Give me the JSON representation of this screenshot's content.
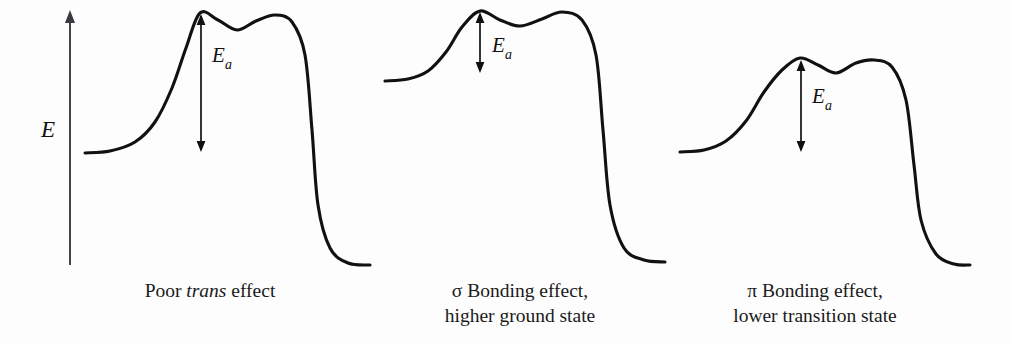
{
  "figure": {
    "type": "reaction-energy-profile-diagram",
    "background_color": "#fdfdfd",
    "curve_color": "#111111",
    "axis_color": "#3a3a40",
    "axis": {
      "label": "E",
      "meaning": "energy",
      "orientation": "vertical",
      "arrow_direction": "up",
      "x": 70,
      "y_top": 10,
      "y_bottom": 265,
      "label_x": 48,
      "label_y": 137
    }
  },
  "panels": [
    {
      "id": "panel-1",
      "caption_lines": [
        "Poor trans effect"
      ],
      "caption_parts": [
        {
          "text": "Poor ",
          "italic": false
        },
        {
          "text": "trans",
          "italic": true
        },
        {
          "text": " effect",
          "italic": false
        }
      ],
      "ea_label": "E",
      "ea_subscript": "a",
      "ea_arrow": {
        "x": 201,
        "y_top": 14,
        "y_bottom": 152
      },
      "ea_label_pos": {
        "x": 212,
        "y": 62
      },
      "ground_state_y": 153,
      "peak1_y": 13,
      "dip_y": 30,
      "peak2_y": 15,
      "product_state_y": 265,
      "x_start": 85,
      "x_end": 370
    },
    {
      "id": "panel-2",
      "caption_lines": [
        "σ Bonding effect,",
        "higher ground state"
      ],
      "caption_parts": [
        {
          "text": "σ Bonding effect,",
          "italic": false
        },
        {
          "text": "higher ground state",
          "italic": false
        }
      ],
      "ea_label": "E",
      "ea_subscript": "a",
      "ea_arrow": {
        "x": 480,
        "y_top": 12,
        "y_bottom": 73
      },
      "ea_label_pos": {
        "x": 492,
        "y": 52
      },
      "ground_state_y": 81,
      "peak1_y": 11,
      "dip_y": 26,
      "peak2_y": 12,
      "product_state_y": 262,
      "x_start": 385,
      "x_end": 665
    },
    {
      "id": "panel-3",
      "caption_lines": [
        "π Bonding effect,",
        "lower transition state"
      ],
      "caption_parts": [
        {
          "text": "π Bonding effect,",
          "italic": false
        },
        {
          "text": "lower transition state",
          "italic": false
        }
      ],
      "ea_label": "E",
      "ea_subscript": "a",
      "ea_arrow": {
        "x": 801,
        "y_top": 60,
        "y_bottom": 152
      },
      "ea_label_pos": {
        "x": 812,
        "y": 103
      },
      "ground_state_y": 152,
      "peak1_y": 58,
      "dip_y": 73,
      "peak2_y": 60,
      "product_state_y": 265,
      "x_start": 680,
      "x_end": 970
    }
  ],
  "chart_data": {
    "type": "line",
    "title": "",
    "xlabel": "reaction coordinate",
    "ylabel": "E",
    "grid": false,
    "legend": "none",
    "note": "Three schematic reaction-coordinate energy profiles, each with a double-humped transition-state region; the vertical double arrow marks the activation energy Ea.",
    "series": [
      {
        "name": "Poor trans effect",
        "points": [
          {
            "x": 85,
            "y": 153
          },
          {
            "x": 110,
            "y": 151
          },
          {
            "x": 135,
            "y": 142
          },
          {
            "x": 155,
            "y": 122
          },
          {
            "x": 172,
            "y": 88
          },
          {
            "x": 186,
            "y": 48
          },
          {
            "x": 200,
            "y": 13
          },
          {
            "x": 218,
            "y": 20
          },
          {
            "x": 237,
            "y": 30
          },
          {
            "x": 256,
            "y": 21
          },
          {
            "x": 275,
            "y": 15
          },
          {
            "x": 292,
            "y": 22
          },
          {
            "x": 305,
            "y": 55
          },
          {
            "x": 312,
            "y": 130
          },
          {
            "x": 318,
            "y": 205
          },
          {
            "x": 330,
            "y": 248
          },
          {
            "x": 348,
            "y": 263
          },
          {
            "x": 370,
            "y": 265
          }
        ]
      },
      {
        "name": "σ Bonding effect, higher ground state",
        "points": [
          {
            "x": 385,
            "y": 81
          },
          {
            "x": 408,
            "y": 79
          },
          {
            "x": 428,
            "y": 71
          },
          {
            "x": 446,
            "y": 52
          },
          {
            "x": 462,
            "y": 27
          },
          {
            "x": 480,
            "y": 11
          },
          {
            "x": 500,
            "y": 20
          },
          {
            "x": 520,
            "y": 26
          },
          {
            "x": 542,
            "y": 19
          },
          {
            "x": 562,
            "y": 12
          },
          {
            "x": 582,
            "y": 20
          },
          {
            "x": 596,
            "y": 55
          },
          {
            "x": 603,
            "y": 130
          },
          {
            "x": 610,
            "y": 205
          },
          {
            "x": 624,
            "y": 248
          },
          {
            "x": 644,
            "y": 260
          },
          {
            "x": 665,
            "y": 262
          }
        ]
      },
      {
        "name": "π Bonding effect, lower transition state",
        "points": [
          {
            "x": 680,
            "y": 152
          },
          {
            "x": 704,
            "y": 150
          },
          {
            "x": 726,
            "y": 141
          },
          {
            "x": 746,
            "y": 121
          },
          {
            "x": 764,
            "y": 92
          },
          {
            "x": 782,
            "y": 70
          },
          {
            "x": 800,
            "y": 58
          },
          {
            "x": 818,
            "y": 65
          },
          {
            "x": 836,
            "y": 73
          },
          {
            "x": 856,
            "y": 63
          },
          {
            "x": 874,
            "y": 60
          },
          {
            "x": 892,
            "y": 67
          },
          {
            "x": 906,
            "y": 100
          },
          {
            "x": 914,
            "y": 165
          },
          {
            "x": 921,
            "y": 220
          },
          {
            "x": 936,
            "y": 254
          },
          {
            "x": 954,
            "y": 264
          },
          {
            "x": 970,
            "y": 265
          }
        ]
      }
    ],
    "annotations": [
      {
        "label": "Ea",
        "panel": "Poor trans effect",
        "y_top": 14,
        "y_bottom": 152,
        "value": 138
      },
      {
        "label": "Ea",
        "panel": "σ Bonding effect, higher ground state",
        "y_top": 12,
        "y_bottom": 73,
        "value": 61
      },
      {
        "label": "Ea",
        "panel": "π Bonding effect, lower transition state",
        "y_top": 60,
        "y_bottom": 152,
        "value": 92
      }
    ]
  }
}
